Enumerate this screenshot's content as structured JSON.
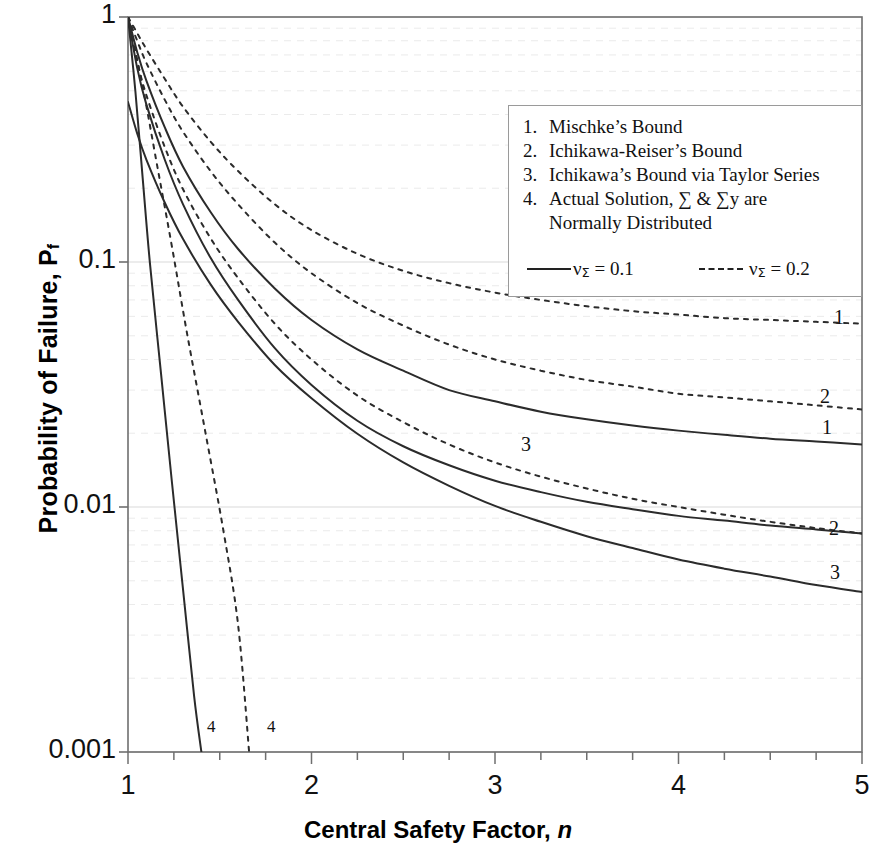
{
  "chart_data": {
    "type": "line",
    "title": "",
    "xlabel": "Central Safety Factor,  n",
    "ylabel": "Probability of Failure, P_f",
    "xlim": [
      1,
      5
    ],
    "ylim": [
      0.001,
      1
    ],
    "yscale": "log",
    "xscale": "linear",
    "grid": "faint horizontal minor log gridlines",
    "legend_position": "upper right inside plot",
    "x_ticks": [
      "1",
      "2",
      "3",
      "4",
      "5"
    ],
    "y_ticks": [
      "1",
      "0.1",
      "0.01",
      "0.001"
    ],
    "x_minor_tick_interval": 0.25,
    "series": [
      {
        "name": "1. Mischke's Bound, nu_Sigma = 0.2",
        "style": "dashed",
        "label": "1",
        "x": [
          1.0,
          1.05,
          1.1,
          1.2,
          1.3,
          1.45,
          1.6,
          1.8,
          2.0,
          2.25,
          2.5,
          2.75,
          3.0,
          3.25,
          3.5,
          3.75,
          4.0,
          4.25,
          4.5,
          4.75,
          5.0
        ],
        "y": [
          1.0,
          0.86,
          0.74,
          0.56,
          0.43,
          0.31,
          0.235,
          0.172,
          0.135,
          0.108,
          0.092,
          0.082,
          0.075,
          0.07,
          0.066,
          0.063,
          0.061,
          0.059,
          0.058,
          0.057,
          0.056
        ]
      },
      {
        "name": "2. Ichikawa-Reiser's Bound, nu_Sigma = 0.2",
        "style": "dashed",
        "label": "2",
        "x": [
          1.0,
          1.05,
          1.1,
          1.2,
          1.3,
          1.45,
          1.6,
          1.8,
          2.0,
          2.25,
          2.5,
          2.75,
          3.0,
          3.25,
          3.5,
          3.75,
          4.0,
          4.25,
          4.5,
          4.75,
          5.0
        ],
        "y": [
          1.0,
          0.8,
          0.65,
          0.46,
          0.34,
          0.235,
          0.172,
          0.12,
          0.09,
          0.068,
          0.055,
          0.046,
          0.04,
          0.036,
          0.033,
          0.031,
          0.029,
          0.028,
          0.027,
          0.026,
          0.025
        ]
      },
      {
        "name": "1. Mischke's Bound, nu_Sigma = 0.1",
        "style": "solid",
        "label": "1",
        "x": [
          1.0,
          1.05,
          1.1,
          1.2,
          1.3,
          1.45,
          1.6,
          1.8,
          2.0,
          2.25,
          2.5,
          2.75,
          3.0,
          3.25,
          3.5,
          3.75,
          4.0,
          4.25,
          4.5,
          4.75,
          5.0
        ],
        "y": [
          1.0,
          0.72,
          0.55,
          0.355,
          0.245,
          0.16,
          0.113,
          0.078,
          0.058,
          0.044,
          0.036,
          0.03,
          0.027,
          0.0245,
          0.0228,
          0.0215,
          0.0205,
          0.0197,
          0.019,
          0.0185,
          0.018
        ]
      },
      {
        "name": "3. Ichikawa's Bound via Taylor Series, nu_Sigma = 0.2",
        "style": "dashed",
        "label": "3",
        "x": [
          1.0,
          1.05,
          1.1,
          1.2,
          1.3,
          1.45,
          1.6,
          1.8,
          2.0,
          2.25,
          2.5,
          2.75,
          3.0,
          3.25,
          3.5,
          3.75,
          4.0,
          4.25,
          4.5,
          4.75,
          5.0
        ],
        "y": [
          1.0,
          0.66,
          0.48,
          0.295,
          0.198,
          0.125,
          0.086,
          0.056,
          0.04,
          0.0285,
          0.0222,
          0.018,
          0.0152,
          0.0133,
          0.0119,
          0.0108,
          0.01,
          0.0093,
          0.0087,
          0.0082,
          0.0078
        ]
      },
      {
        "name": "2. Ichikawa-Reiser's Bound, nu_Sigma = 0.1",
        "style": "solid",
        "label": "2",
        "x": [
          1.0,
          1.05,
          1.1,
          1.2,
          1.3,
          1.45,
          1.6,
          1.8,
          2.0,
          2.25,
          2.5,
          2.75,
          3.0,
          3.25,
          3.5,
          3.75,
          4.0,
          4.25,
          4.5,
          4.75,
          5.0
        ],
        "y": [
          1.0,
          0.62,
          0.44,
          0.262,
          0.172,
          0.104,
          0.07,
          0.0445,
          0.0315,
          0.0225,
          0.0177,
          0.0148,
          0.0128,
          0.0115,
          0.0105,
          0.0098,
          0.0092,
          0.0088,
          0.0084,
          0.0081,
          0.0078
        ]
      },
      {
        "name": "3. Ichikawa's Bound via Taylor Series, nu_Sigma = 0.1",
        "style": "solid",
        "label": "3",
        "x": [
          1.0,
          1.05,
          1.1,
          1.2,
          1.3,
          1.45,
          1.6,
          1.8,
          2.0,
          2.25,
          2.5,
          2.75,
          3.0,
          3.25,
          3.5,
          3.75,
          4.0,
          4.25,
          4.5,
          4.75,
          5.0
        ],
        "y": [
          0.45,
          0.335,
          0.262,
          0.175,
          0.124,
          0.081,
          0.057,
          0.038,
          0.0278,
          0.0199,
          0.0152,
          0.0122,
          0.0101,
          0.0087,
          0.0076,
          0.0068,
          0.0061,
          0.0056,
          0.0052,
          0.0048,
          0.0045
        ]
      },
      {
        "name": "4. Actual Solution, nu_Sigma = 0.1",
        "style": "solid",
        "label": "4",
        "x": [
          1.0,
          1.04,
          1.08,
          1.12,
          1.18,
          1.24,
          1.3,
          1.36,
          1.4
        ],
        "y": [
          1.0,
          0.5,
          0.22,
          0.098,
          0.035,
          0.0125,
          0.0046,
          0.0017,
          0.001
        ]
      },
      {
        "name": "4. Actual Solution, nu_Sigma = 0.2",
        "style": "dashed",
        "label": "4",
        "x": [
          1.0,
          1.08,
          1.16,
          1.24,
          1.32,
          1.42,
          1.52,
          1.6,
          1.66
        ],
        "y": [
          1.0,
          0.52,
          0.245,
          0.115,
          0.052,
          0.0205,
          0.008,
          0.0033,
          0.001
        ]
      }
    ]
  },
  "axes": {
    "y_label_main": "Probability of Failure, P",
    "y_label_sub": "f",
    "x_label_main": "Central Safety Factor, ",
    "x_label_italic": "n",
    "y_ticks": [
      {
        "text": "1",
        "value": 1
      },
      {
        "text": "0.1",
        "value": 0.1
      },
      {
        "text": "0.01",
        "value": 0.01
      },
      {
        "text": "0.001",
        "value": 0.001
      }
    ],
    "x_ticks": [
      {
        "text": "1",
        "value": 1
      },
      {
        "text": "2",
        "value": 2
      },
      {
        "text": "3",
        "value": 3
      },
      {
        "text": "4",
        "value": 4
      },
      {
        "text": "5",
        "value": 5
      }
    ]
  },
  "legend": {
    "items": [
      {
        "num": "1.",
        "text": "Mischke’s Bound"
      },
      {
        "num": "2.",
        "text": "Ichikawa-Reiser’s Bound"
      },
      {
        "num": "3.",
        "text": "Ichikawa’s Bound via Taylor Series"
      },
      {
        "num": "4.",
        "text": "Actual Solution, ∑ & ∑y are",
        "continuation": "Normally Distributed"
      }
    ],
    "keys": [
      {
        "style": "solid",
        "symbol": "ν",
        "sub": "Σ",
        "text": " = 0.1"
      },
      {
        "style": "dashed",
        "symbol": "ν",
        "sub": "Σ",
        "text": " = 0.2"
      }
    ]
  },
  "curve_labels": [
    {
      "text": "1",
      "x": 834,
      "y": 306,
      "size": "normal"
    },
    {
      "text": "2",
      "x": 820,
      "y": 385,
      "size": "normal"
    },
    {
      "text": "1",
      "x": 822,
      "y": 416,
      "size": "normal"
    },
    {
      "text": "3",
      "x": 521,
      "y": 433,
      "size": "normal"
    },
    {
      "text": "2",
      "x": 829,
      "y": 517,
      "size": "normal"
    },
    {
      "text": "3",
      "x": 830,
      "y": 561,
      "size": "normal"
    },
    {
      "text": "4",
      "x": 207,
      "y": 717,
      "size": "small"
    },
    {
      "text": "4",
      "x": 267,
      "y": 717,
      "size": "small"
    }
  ],
  "colors": {
    "curve": "#2b2b2b",
    "axis": "#6f6f6f",
    "grid": "#e8e8e8",
    "background": "#ffffff",
    "text": "#111111"
  }
}
